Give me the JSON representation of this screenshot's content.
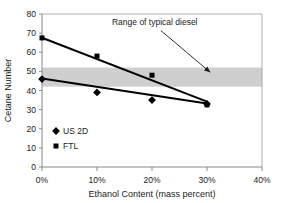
{
  "chart_data": {
    "type": "scatter",
    "title": "",
    "xlabel": "Ethanol Content (mass percent)",
    "ylabel": "Cetane Number",
    "xlim": [
      0,
      40
    ],
    "ylim": [
      0,
      80
    ],
    "xticks": [
      0,
      10,
      20,
      30,
      40
    ],
    "xtick_labels": [
      "0%",
      "10%",
      "20%",
      "30%",
      "40%"
    ],
    "yticks": [
      0,
      10,
      20,
      30,
      40,
      50,
      60,
      70,
      80
    ],
    "ytick_labels": [
      "0",
      "10",
      "20",
      "30",
      "40",
      "50",
      "60",
      "70",
      "80"
    ],
    "grid": false,
    "legend_position": "inside-lower-left",
    "x": [
      0,
      10,
      20,
      30
    ],
    "series": [
      {
        "name": "US 2D",
        "marker": "diamond",
        "color": "#000000",
        "values": [
          46,
          39,
          35,
          33
        ],
        "trendline": {
          "x0": 0,
          "y0": 46.3,
          "x1": 30,
          "y1": 33.2
        }
      },
      {
        "name": "FTL",
        "marker": "square",
        "color": "#000000",
        "values": [
          67.5,
          58,
          48,
          32.5
        ],
        "trendline": {
          "x0": 0,
          "y0": 67.6,
          "x1": 30,
          "y1": 34.2
        }
      }
    ],
    "bands": [
      {
        "label": "Range of typical diesel",
        "orientation": "horizontal",
        "y_low": 42,
        "y_high": 52,
        "color": "#cfcfcf"
      }
    ],
    "annotations": [
      {
        "text": "Range of typical diesel",
        "text_x": 20.5,
        "text_y": 74,
        "arrow_to_x": 30.6,
        "arrow_to_y": 49.5
      }
    ],
    "colors": {
      "axis": "#808080",
      "marker": "#000000",
      "trendline": "#000000",
      "band": "#cfcfcf",
      "background": "#ffffff",
      "text": "#1a1a1a"
    }
  }
}
